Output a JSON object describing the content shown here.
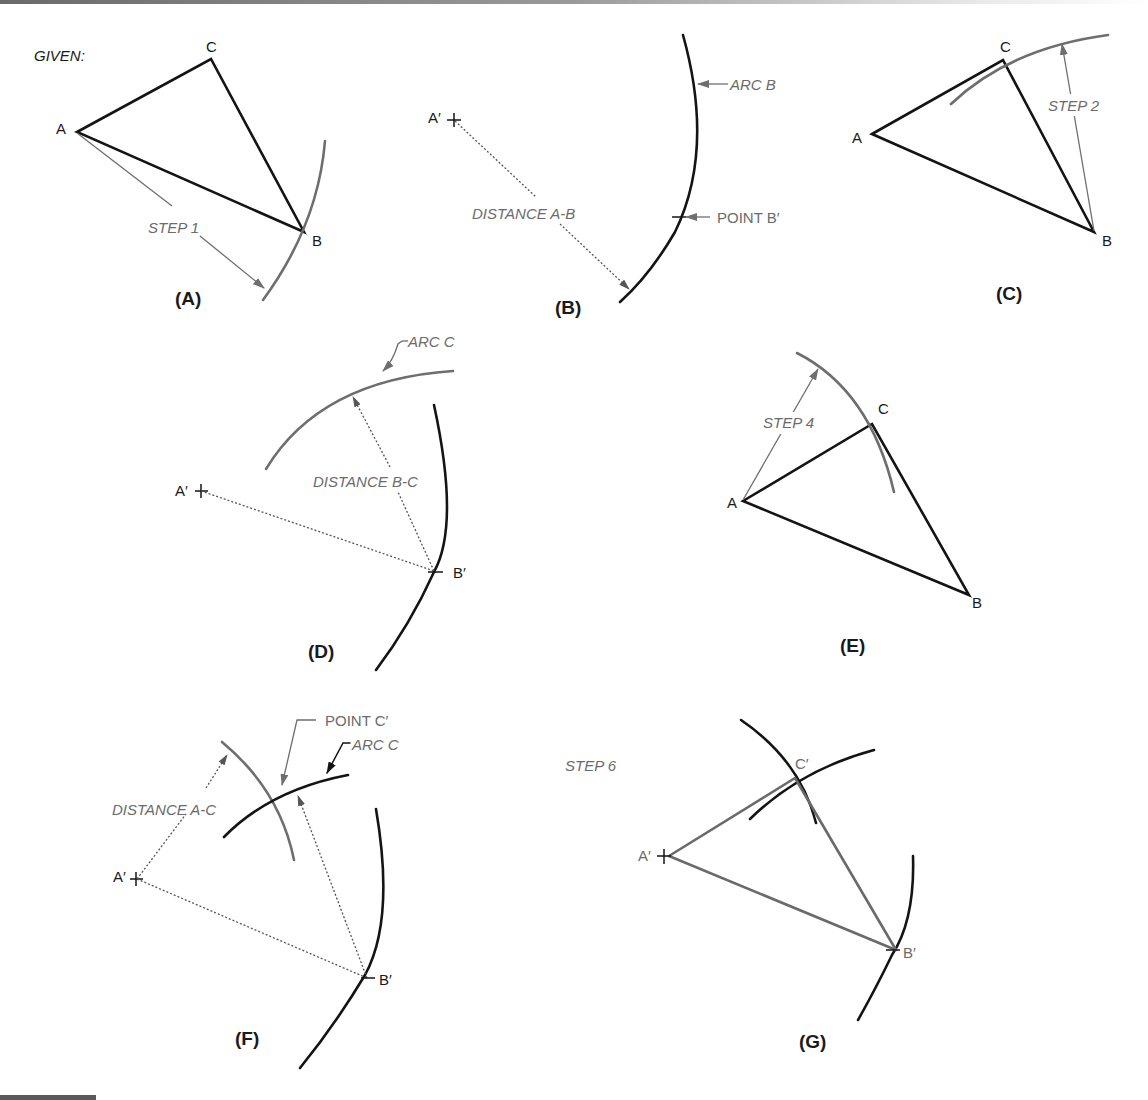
{
  "figure": {
    "given_label": "GIVEN:",
    "colors": {
      "black": "#141414",
      "gray": "#6e6e6e",
      "background": "#ffffff"
    },
    "panels": [
      {
        "id": "A",
        "label": "(A)",
        "vertices": {
          "A": "A",
          "B": "B",
          "C": "C"
        },
        "annotations": [
          "STEP 1"
        ]
      },
      {
        "id": "B",
        "label": "(B)",
        "points": {
          "A_prime": "A′"
        },
        "annotations": [
          "ARC B",
          "DISTANCE A-B",
          "POINT B′"
        ]
      },
      {
        "id": "C",
        "label": "(C)",
        "vertices": {
          "A": "A",
          "B": "B",
          "C": "C"
        },
        "annotations": [
          "STEP 2"
        ]
      },
      {
        "id": "D",
        "label": "(D)",
        "points": {
          "A_prime": "A′",
          "B_prime": "B′"
        },
        "annotations": [
          "ARC C",
          "DISTANCE B-C"
        ]
      },
      {
        "id": "E",
        "label": "(E)",
        "vertices": {
          "A": "A",
          "B": "B",
          "C": "C"
        },
        "annotations": [
          "STEP 4"
        ]
      },
      {
        "id": "F",
        "label": "(F)",
        "points": {
          "A_prime": "A′",
          "B_prime": "B′"
        },
        "annotations": [
          "POINT C′",
          "ARC C",
          "DISTANCE A-C"
        ]
      },
      {
        "id": "G",
        "label": "(G)",
        "points": {
          "A_prime": "A′",
          "B_prime": "B′",
          "C_prime": "C′"
        },
        "annotations": [
          "STEP 6"
        ]
      }
    ]
  }
}
